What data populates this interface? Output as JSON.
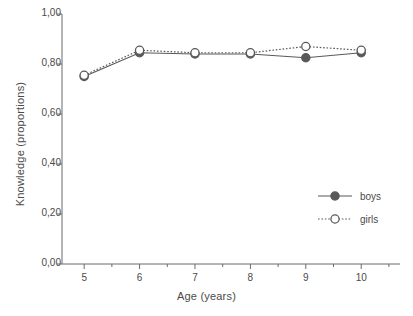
{
  "chart_data": {
    "type": "line",
    "title": "",
    "xlabel": "Age (years)",
    "ylabel": "Knowledge (proportions)",
    "x": [
      5,
      6,
      7,
      8,
      9,
      10
    ],
    "xtick_labels": [
      "5",
      "6",
      "7",
      "8",
      "9",
      "10"
    ],
    "ytick_labels": [
      "0,00",
      "0,20",
      "0,40",
      "0,60",
      "0,80",
      "1,00"
    ],
    "ytick_values": [
      0.0,
      0.2,
      0.4,
      0.6,
      0.8,
      1.0
    ],
    "xlim": [
      4.6,
      10.7
    ],
    "ylim": [
      0.0,
      1.0
    ],
    "grid": false,
    "decimal_separator": ",",
    "legend_position": "lower-right-inside",
    "series": [
      {
        "name": "boys",
        "values": [
          0.75,
          0.845,
          0.84,
          0.84,
          0.825,
          0.845
        ],
        "marker": "filled-circle",
        "line_style": "solid",
        "color": "#595959"
      },
      {
        "name": "girls",
        "values": [
          0.755,
          0.855,
          0.845,
          0.845,
          0.87,
          0.855
        ],
        "marker": "open-circle",
        "line_style": "dotted",
        "color": "#595959"
      }
    ]
  },
  "legend": {
    "items": [
      {
        "label": "boys"
      },
      {
        "label": "girls"
      }
    ]
  },
  "colors": {
    "line": "#595959",
    "axis": "#6b6b6b",
    "text": "#4a4a4a",
    "background": "#ffffff",
    "marker_fill_open": "#ffffff"
  }
}
